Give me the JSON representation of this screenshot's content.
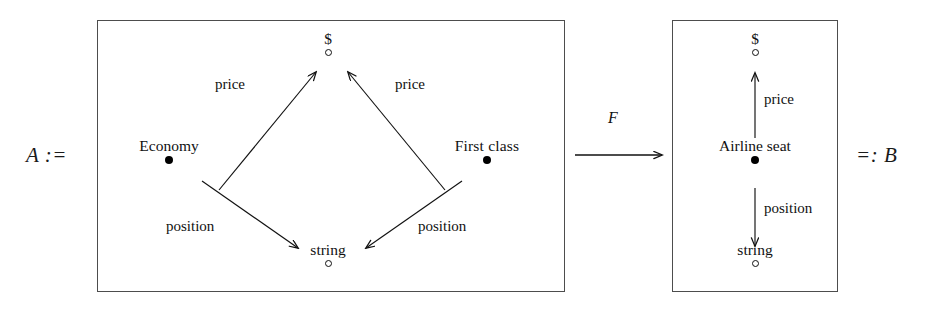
{
  "figure": {
    "type": "diagram",
    "kind": "category-theory-schema-morphism",
    "left_assignment": "A :=",
    "right_assignment": "=: B",
    "functor_label": "F"
  },
  "schema_a": {
    "nodes": {
      "dollar": {
        "label": "$",
        "kind": "attribute",
        "marker": "open-circle"
      },
      "economy": {
        "label": "Economy",
        "kind": "entity",
        "marker": "filled-dot"
      },
      "first_class": {
        "label": "First  class",
        "kind": "entity",
        "marker": "filled-dot"
      },
      "string": {
        "label": "string",
        "kind": "attribute",
        "marker": "open-circle"
      }
    },
    "edges": [
      {
        "from": "economy",
        "to": "dollar",
        "label": "price"
      },
      {
        "from": "first_class",
        "to": "dollar",
        "label": "price"
      },
      {
        "from": "economy",
        "to": "string",
        "label": "position"
      },
      {
        "from": "first_class",
        "to": "string",
        "label": "position"
      }
    ]
  },
  "schema_b": {
    "nodes": {
      "dollar": {
        "label": "$",
        "kind": "attribute",
        "marker": "open-circle"
      },
      "airline_seat": {
        "label": "Airline seat",
        "kind": "entity",
        "marker": "filled-dot"
      },
      "string": {
        "label": "string",
        "kind": "attribute",
        "marker": "open-circle"
      }
    },
    "edges": [
      {
        "from": "airline_seat",
        "to": "dollar",
        "label": "price"
      },
      {
        "from": "airline_seat",
        "to": "string",
        "label": "position"
      }
    ]
  },
  "colors": {
    "ink": "#111111",
    "box_border": "#4d4d4d",
    "background": "#ffffff"
  }
}
